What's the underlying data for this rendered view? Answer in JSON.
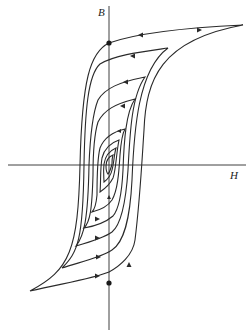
{
  "figure": {
    "axes": {
      "x_label": "H",
      "y_label": "B"
    },
    "loops": [
      {
        "name": "major-loop",
        "index": 1
      },
      {
        "name": "loop-2",
        "index": 2
      },
      {
        "name": "loop-3",
        "index": 3
      },
      {
        "name": "loop-4",
        "index": 4
      },
      {
        "name": "loop-5",
        "index": 5
      },
      {
        "name": "loop-6",
        "index": 6
      },
      {
        "name": "loop-7",
        "index": 7
      },
      {
        "name": "loop-8",
        "index": 8
      }
    ],
    "markers": [
      {
        "name": "remanence-positive",
        "description": "dot on B axis, upper"
      },
      {
        "name": "remanence-negative",
        "description": "dot on B axis, lower"
      }
    ],
    "colors": {
      "line": "#2a2a2a",
      "background": "#ffffff"
    }
  }
}
